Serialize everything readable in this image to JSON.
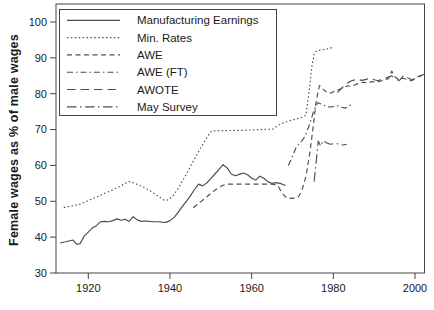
{
  "figure": {
    "y_axis_title": "Female wages as % of male wages",
    "y_ticks": [
      "100",
      "90",
      "80",
      "70",
      "60",
      "50",
      "40",
      "30"
    ],
    "x_ticks": [
      "1920",
      "1940",
      "1960",
      "1980",
      "2000"
    ]
  },
  "colors": {
    "line": "#4d4d4d",
    "frame": "#444444",
    "text": "#1a1a1a",
    "background": "#ffffff"
  },
  "chart_data": {
    "type": "line",
    "title": "",
    "xlabel": "",
    "ylabel": "Female wages as % of male wages",
    "xlim": [
      1912.2,
      2002.5
    ],
    "ylim": [
      30,
      105
    ],
    "grid": false,
    "legend_position": "top-left-inside",
    "series": [
      {
        "name": "Manufacturing Earnings",
        "line_style": "solid",
        "points": [
          [
            1913.2,
            38.4
          ],
          [
            1914.5,
            38.7
          ],
          [
            1915.5,
            39.0
          ],
          [
            1916.2,
            39.2
          ],
          [
            1917.2,
            38.0
          ],
          [
            1918,
            38.2
          ],
          [
            1919,
            40.3
          ],
          [
            1920,
            41.4
          ],
          [
            1921,
            42.6
          ],
          [
            1922,
            43.2
          ],
          [
            1923,
            44.3
          ],
          [
            1924,
            44.4
          ],
          [
            1925,
            44.3
          ],
          [
            1926,
            44.6
          ],
          [
            1927,
            45.1
          ],
          [
            1928,
            44.7
          ],
          [
            1929,
            45.0
          ],
          [
            1930,
            44.4
          ],
          [
            1931,
            45.7
          ],
          [
            1932,
            44.8
          ],
          [
            1933,
            44.4
          ],
          [
            1934,
            44.5
          ],
          [
            1935,
            44.4
          ],
          [
            1936,
            44.3
          ],
          [
            1937,
            44.3
          ],
          [
            1938,
            44.2
          ],
          [
            1939,
            44.1
          ],
          [
            1940,
            44.6
          ],
          [
            1941,
            45.5
          ],
          [
            1942,
            46.9
          ],
          [
            1943,
            48.5
          ],
          [
            1944,
            50.0
          ],
          [
            1945,
            51.5
          ],
          [
            1946,
            53.3
          ],
          [
            1947,
            54.8
          ],
          [
            1948,
            54.3
          ],
          [
            1949,
            55.1
          ],
          [
            1950,
            56.3
          ],
          [
            1951,
            57.6
          ],
          [
            1952,
            58.9
          ],
          [
            1953,
            60.2
          ],
          [
            1954,
            59.3
          ],
          [
            1955,
            57.6
          ],
          [
            1956,
            57.1
          ],
          [
            1957,
            57.5
          ],
          [
            1958,
            57.9
          ],
          [
            1959,
            57.4
          ],
          [
            1960,
            56.4
          ],
          [
            1961,
            55.9
          ],
          [
            1962,
            57.0
          ],
          [
            1963,
            56.4
          ],
          [
            1964,
            55.4
          ],
          [
            1965,
            55.0
          ],
          [
            1966,
            55.2
          ],
          [
            1967,
            55.0
          ],
          [
            1968.3,
            54.4
          ]
        ]
      },
      {
        "name": "Min. Rates",
        "line_style": "dotted",
        "points": [
          [
            1914,
            48.3
          ],
          [
            1916,
            48.7
          ],
          [
            1918,
            49.2
          ],
          [
            1920,
            50.2
          ],
          [
            1922,
            51.2
          ],
          [
            1924,
            52.2
          ],
          [
            1926,
            53.2
          ],
          [
            1928,
            54.3
          ],
          [
            1929,
            55.0
          ],
          [
            1930,
            55.5
          ],
          [
            1931,
            55.2
          ],
          [
            1933,
            54.2
          ],
          [
            1935,
            53.0
          ],
          [
            1937,
            51.5
          ],
          [
            1938.7,
            50.2
          ],
          [
            1939.5,
            50.4
          ],
          [
            1940.5,
            51.2
          ],
          [
            1942,
            53.5
          ],
          [
            1944,
            57.5
          ],
          [
            1946,
            61.8
          ],
          [
            1947.5,
            64.8
          ],
          [
            1949,
            67.8
          ],
          [
            1950.2,
            69.6
          ],
          [
            1952,
            69.7
          ],
          [
            1954,
            69.7
          ],
          [
            1956,
            69.8
          ],
          [
            1958,
            69.8
          ],
          [
            1960,
            69.9
          ],
          [
            1962,
            70.0
          ],
          [
            1964,
            70.1
          ],
          [
            1965,
            70.0
          ],
          [
            1966.5,
            71.2
          ],
          [
            1968,
            72.0
          ],
          [
            1970,
            72.7
          ],
          [
            1972,
            73.2
          ],
          [
            1973.3,
            74.0
          ],
          [
            1974,
            80.0
          ],
          [
            1974.8,
            88.0
          ],
          [
            1975.4,
            91.5
          ],
          [
            1976,
            92.0
          ],
          [
            1977,
            92.2
          ],
          [
            1978,
            92.4
          ],
          [
            1979,
            92.6
          ],
          [
            1980,
            93.0
          ]
        ]
      },
      {
        "name": "AWE",
        "line_style": "dashed",
        "points": [
          [
            1945.7,
            48.2
          ],
          [
            1947,
            49.4
          ],
          [
            1948,
            50.3
          ],
          [
            1949,
            51.2
          ],
          [
            1950,
            52.2
          ],
          [
            1951,
            53.1
          ],
          [
            1952,
            53.9
          ],
          [
            1953,
            54.5
          ],
          [
            1954,
            54.8
          ],
          [
            1956,
            54.8
          ],
          [
            1958,
            54.8
          ],
          [
            1960,
            54.8
          ],
          [
            1962,
            54.8
          ],
          [
            1964,
            54.8
          ],
          [
            1965.5,
            54.7
          ],
          [
            1966.5,
            54.2
          ],
          [
            1967.5,
            52.2
          ],
          [
            1968.5,
            51.0
          ],
          [
            1969.5,
            50.8
          ],
          [
            1970.5,
            50.9
          ],
          [
            1971.5,
            51.3
          ],
          [
            1972.3,
            53.0
          ],
          [
            1973.3,
            57.0
          ],
          [
            1974.3,
            64.0
          ],
          [
            1975.2,
            72.0
          ],
          [
            1975.8,
            78.0
          ],
          [
            1976.6,
            82.3
          ],
          [
            1977.5,
            81.2
          ],
          [
            1978.5,
            80.3
          ],
          [
            1979.5,
            80.2
          ],
          [
            1980.5,
            80.8
          ],
          [
            1981.5,
            81.2
          ],
          [
            1982.5,
            81.7
          ],
          [
            1983.5,
            82.2
          ],
          [
            1984.5,
            82.0
          ],
          [
            1985.5,
            82.6
          ],
          [
            1986.5,
            83.0
          ],
          [
            1987.5,
            83.2
          ],
          [
            1988.5,
            83.0
          ],
          [
            1989.5,
            83.4
          ],
          [
            1990.5,
            83.1
          ],
          [
            1991.5,
            83.5
          ],
          [
            1992.5,
            83.9
          ],
          [
            1993.5,
            84.2
          ],
          [
            1994.3,
            86.3
          ],
          [
            1995,
            84.8
          ],
          [
            1996,
            83.9
          ],
          [
            1997,
            84.3
          ],
          [
            1998,
            84.0
          ],
          [
            1999,
            83.6
          ],
          [
            2000,
            84.1
          ],
          [
            2001,
            84.9
          ],
          [
            2002.3,
            85.3
          ]
        ]
      },
      {
        "name": "AWE (FT)",
        "line_style": "dash_dot",
        "points": [
          [
            1969,
            60.0
          ],
          [
            1970,
            62.6
          ],
          [
            1971,
            65.3
          ],
          [
            1972,
            66.4
          ],
          [
            1973,
            68.0
          ],
          [
            1974.2,
            71.5
          ],
          [
            1975.2,
            75.2
          ],
          [
            1976.2,
            77.5
          ],
          [
            1977,
            77.1
          ],
          [
            1978,
            76.6
          ],
          [
            1979,
            76.3
          ],
          [
            1980,
            76.4
          ],
          [
            1981,
            76.6
          ],
          [
            1982,
            76.2
          ],
          [
            1983,
            76.0
          ],
          [
            1984.3,
            76.9
          ]
        ]
      },
      {
        "name": "AWOTE",
        "line_style": "long_dash",
        "points": [
          [
            1981,
            80.3
          ],
          [
            1982,
            81.5
          ],
          [
            1983,
            82.5
          ],
          [
            1984,
            83.4
          ],
          [
            1985,
            83.8
          ],
          [
            1986,
            84.0
          ],
          [
            1987,
            83.7
          ],
          [
            1988,
            84.0
          ],
          [
            1989,
            84.3
          ],
          [
            1990,
            83.9
          ],
          [
            1991,
            83.6
          ],
          [
            1992,
            84.2
          ],
          [
            1993,
            84.4
          ],
          [
            1994.3,
            85.0
          ],
          [
            1995.2,
            84.0
          ],
          [
            1996.2,
            83.7
          ],
          [
            1997.3,
            85.2
          ],
          [
            1998.3,
            84.4
          ],
          [
            1999.3,
            83.8
          ],
          [
            2000.2,
            84.4
          ],
          [
            2001.2,
            84.9
          ],
          [
            2002.4,
            85.5
          ]
        ]
      },
      {
        "name": "May Survey",
        "line_style": "long_dash_dot",
        "points": [
          [
            1975.3,
            55.5
          ],
          [
            1975.8,
            61.0
          ],
          [
            1976.3,
            66.8
          ],
          [
            1976.9,
            65.4
          ],
          [
            1977.5,
            66.9
          ],
          [
            1978.3,
            66.3
          ],
          [
            1979.2,
            65.9
          ],
          [
            1980.2,
            66.1
          ],
          [
            1981.2,
            66.0
          ],
          [
            1982.2,
            65.7
          ],
          [
            1983.3,
            65.9
          ]
        ]
      }
    ]
  }
}
